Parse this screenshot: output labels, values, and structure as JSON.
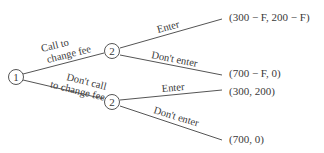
{
  "diagram": {
    "type": "game-tree",
    "nodes": [
      {
        "id": "n1",
        "label": "1",
        "x": 16,
        "y": 77
      },
      {
        "id": "n2a",
        "label": "2",
        "x": 112,
        "y": 51
      },
      {
        "id": "n2b",
        "label": "2",
        "x": 112,
        "y": 102
      }
    ],
    "edges": [
      {
        "from": "n1",
        "to": "n2a",
        "label_line1": "Call to",
        "label_line2": "change fee"
      },
      {
        "from": "n1",
        "to": "n2b",
        "label_line1": "Don't call",
        "label_line2": "to change fee"
      },
      {
        "from": "n2a",
        "label": "Enter",
        "payoff": "(300 − F, 200 − F)"
      },
      {
        "from": "n2a",
        "label": "Don't enter",
        "payoff": "(700 − F, 0)"
      },
      {
        "from": "n2b",
        "label": "Enter",
        "payoff": "(300, 200)"
      },
      {
        "from": "n2b",
        "label": "Don't enter",
        "payoff": "(700, 0)"
      }
    ]
  }
}
